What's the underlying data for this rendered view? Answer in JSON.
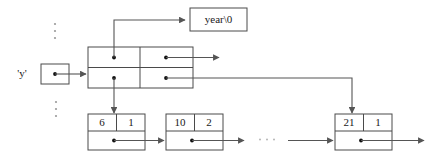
{
  "diagram": {
    "colors": {
      "background": "#ffffff",
      "stroke": "#4a4a4a",
      "line": "#555555",
      "dot": "#111111",
      "text": "#1a1a1a",
      "ellipsis": "#9a9a9a"
    },
    "variable": {
      "label": "'y'",
      "cell_name": "y-pointer-cell"
    },
    "string_box": {
      "label": "year\\0"
    },
    "pointer_table": {
      "name": "two-by-two-pointer-table",
      "cells": [
        {
          "id": "cell-top-left",
          "value": "",
          "has_pointer": true
        },
        {
          "id": "cell-top-right",
          "value": "",
          "has_pointer": true
        },
        {
          "id": "cell-bottom-left",
          "value": "",
          "has_pointer": true
        },
        {
          "id": "cell-bottom-right",
          "value": "",
          "has_pointer": true
        }
      ]
    },
    "list_nodes": [
      {
        "id": "node-1",
        "key": "6",
        "count": "1",
        "has_next_pointer": true
      },
      {
        "id": "node-2",
        "key": "10",
        "count": "2",
        "has_next_pointer": true
      },
      {
        "id": "node-3",
        "key": "21",
        "count": "1",
        "has_next_pointer": true
      }
    ],
    "ellipsis": {
      "vertical_top": "⋮",
      "vertical_bottom": "⋮",
      "horizontal": "· · ·"
    }
  }
}
